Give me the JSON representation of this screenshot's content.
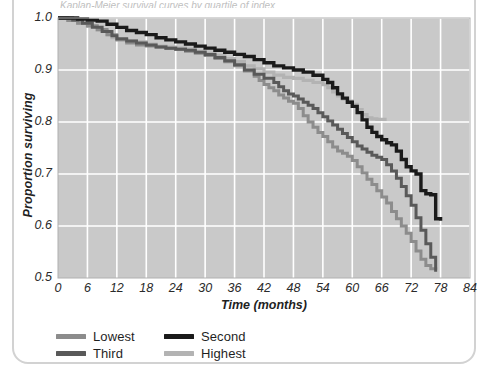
{
  "figure": {
    "title_clipped": "Kaplan-Meier survival curves by quartile of index",
    "background": "#ffffff",
    "frame_color": "#d2d2d2"
  },
  "chart_data": {
    "type": "line",
    "subtype": "kaplan-meier-step",
    "title": "",
    "xlabel": "Time (months)",
    "ylabel": "Proportion surviving",
    "xlim": [
      0,
      84
    ],
    "ylim": [
      0.5,
      1.0
    ],
    "xticks": [
      0,
      6,
      12,
      18,
      24,
      30,
      36,
      42,
      48,
      54,
      60,
      66,
      72,
      78,
      84
    ],
    "yticks": [
      0.5,
      0.6,
      0.7,
      0.8,
      0.9,
      1.0
    ],
    "xtick_labels": [
      "0",
      "6",
      "12",
      "18",
      "24",
      "30",
      "36",
      "42",
      "48",
      "54",
      "60",
      "66",
      "72",
      "78",
      "84"
    ],
    "ytick_labels": [
      "0.5",
      "0.6",
      "0.7",
      "0.8",
      "0.9",
      "1.0"
    ],
    "grid": true,
    "grid_color": "#ffffff",
    "plot_background": "#c9c9c9",
    "legend_position": "below-left",
    "legend_entries": [
      "Lowest",
      "Second",
      "Third",
      "Highest"
    ],
    "series": [
      {
        "name": "Lowest",
        "color": "#8c8c8c",
        "linewidth": 3.0,
        "points": [
          [
            0,
            1.0
          ],
          [
            2,
            0.995
          ],
          [
            4,
            0.99
          ],
          [
            6,
            0.985
          ],
          [
            8,
            0.978
          ],
          [
            10,
            0.968
          ],
          [
            12,
            0.958
          ],
          [
            14,
            0.952
          ],
          [
            16,
            0.948
          ],
          [
            18,
            0.946
          ],
          [
            20,
            0.944
          ],
          [
            22,
            0.942
          ],
          [
            24,
            0.94
          ],
          [
            26,
            0.936
          ],
          [
            28,
            0.932
          ],
          [
            30,
            0.928
          ],
          [
            32,
            0.922
          ],
          [
            34,
            0.916
          ],
          [
            36,
            0.908
          ],
          [
            38,
            0.898
          ],
          [
            40,
            0.888
          ],
          [
            41,
            0.88
          ],
          [
            42,
            0.872
          ],
          [
            43,
            0.866
          ],
          [
            44,
            0.86
          ],
          [
            45,
            0.852
          ],
          [
            46,
            0.846
          ],
          [
            47,
            0.84
          ],
          [
            48,
            0.836
          ],
          [
            49,
            0.826
          ],
          [
            50,
            0.812
          ],
          [
            51,
            0.8
          ],
          [
            52,
            0.79
          ],
          [
            53,
            0.78
          ],
          [
            54,
            0.772
          ],
          [
            55,
            0.762
          ],
          [
            56,
            0.752
          ],
          [
            57,
            0.744
          ],
          [
            58,
            0.74
          ],
          [
            59,
            0.734
          ],
          [
            60,
            0.726
          ],
          [
            61,
            0.714
          ],
          [
            62,
            0.702
          ],
          [
            63,
            0.69
          ],
          [
            64,
            0.68
          ],
          [
            65,
            0.668
          ],
          [
            66,
            0.656
          ],
          [
            67,
            0.644
          ],
          [
            68,
            0.628
          ],
          [
            69,
            0.614
          ],
          [
            70,
            0.6
          ],
          [
            71,
            0.586
          ],
          [
            72,
            0.57
          ],
          [
            73,
            0.552
          ],
          [
            74,
            0.536
          ],
          [
            75,
            0.524
          ],
          [
            76,
            0.518
          ],
          [
            77,
            0.516
          ]
        ]
      },
      {
        "name": "Second",
        "color": "#1a1a1a",
        "linewidth": 3.4,
        "points": [
          [
            0,
            1.0
          ],
          [
            4,
            0.998
          ],
          [
            6,
            0.996
          ],
          [
            8,
            0.994
          ],
          [
            10,
            0.988
          ],
          [
            12,
            0.982
          ],
          [
            14,
            0.976
          ],
          [
            16,
            0.972
          ],
          [
            18,
            0.968
          ],
          [
            20,
            0.962
          ],
          [
            22,
            0.958
          ],
          [
            24,
            0.954
          ],
          [
            26,
            0.95
          ],
          [
            28,
            0.946
          ],
          [
            30,
            0.942
          ],
          [
            32,
            0.938
          ],
          [
            34,
            0.934
          ],
          [
            36,
            0.93
          ],
          [
            38,
            0.926
          ],
          [
            40,
            0.92
          ],
          [
            42,
            0.914
          ],
          [
            44,
            0.908
          ],
          [
            46,
            0.904
          ],
          [
            48,
            0.9
          ],
          [
            50,
            0.896
          ],
          [
            52,
            0.89
          ],
          [
            54,
            0.882
          ],
          [
            55,
            0.876
          ],
          [
            56,
            0.866
          ],
          [
            57,
            0.854
          ],
          [
            58,
            0.846
          ],
          [
            59,
            0.838
          ],
          [
            60,
            0.83
          ],
          [
            61,
            0.818
          ],
          [
            62,
            0.804
          ],
          [
            63,
            0.79
          ],
          [
            64,
            0.78
          ],
          [
            65,
            0.772
          ],
          [
            66,
            0.766
          ],
          [
            67,
            0.76
          ],
          [
            68,
            0.756
          ],
          [
            69,
            0.744
          ],
          [
            70,
            0.728
          ],
          [
            71,
            0.714
          ],
          [
            72,
            0.706
          ],
          [
            73,
            0.7
          ],
          [
            74,
            0.668
          ],
          [
            75,
            0.662
          ],
          [
            76,
            0.66
          ],
          [
            77,
            0.614
          ],
          [
            78,
            0.61
          ]
        ]
      },
      {
        "name": "Third",
        "color": "#595959",
        "linewidth": 3.0,
        "points": [
          [
            0,
            1.0
          ],
          [
            3,
            0.996
          ],
          [
            5,
            0.99
          ],
          [
            7,
            0.982
          ],
          [
            9,
            0.974
          ],
          [
            11,
            0.966
          ],
          [
            12,
            0.96
          ],
          [
            14,
            0.956
          ],
          [
            16,
            0.952
          ],
          [
            18,
            0.948
          ],
          [
            20,
            0.944
          ],
          [
            22,
            0.942
          ],
          [
            24,
            0.94
          ],
          [
            26,
            0.938
          ],
          [
            28,
            0.934
          ],
          [
            30,
            0.93
          ],
          [
            32,
            0.924
          ],
          [
            34,
            0.918
          ],
          [
            36,
            0.91
          ],
          [
            38,
            0.9
          ],
          [
            40,
            0.892
          ],
          [
            42,
            0.884
          ],
          [
            44,
            0.876
          ],
          [
            45,
            0.868
          ],
          [
            46,
            0.86
          ],
          [
            47,
            0.854
          ],
          [
            48,
            0.85
          ],
          [
            49,
            0.844
          ],
          [
            50,
            0.838
          ],
          [
            51,
            0.832
          ],
          [
            52,
            0.826
          ],
          [
            53,
            0.818
          ],
          [
            54,
            0.81
          ],
          [
            55,
            0.802
          ],
          [
            56,
            0.794
          ],
          [
            57,
            0.786
          ],
          [
            58,
            0.778
          ],
          [
            59,
            0.77
          ],
          [
            60,
            0.762
          ],
          [
            61,
            0.754
          ],
          [
            62,
            0.748
          ],
          [
            63,
            0.742
          ],
          [
            64,
            0.736
          ],
          [
            65,
            0.732
          ],
          [
            66,
            0.728
          ],
          [
            67,
            0.718
          ],
          [
            68,
            0.706
          ],
          [
            69,
            0.692
          ],
          [
            70,
            0.676
          ],
          [
            71,
            0.658
          ],
          [
            72,
            0.64
          ],
          [
            73,
            0.616
          ],
          [
            74,
            0.592
          ],
          [
            75,
            0.566
          ],
          [
            76,
            0.54
          ],
          [
            77,
            0.512
          ]
        ]
      },
      {
        "name": "Highest",
        "color": "#b3b3b3",
        "linewidth": 3.2,
        "points": [
          [
            0,
            1.0
          ],
          [
            2,
            0.996
          ],
          [
            4,
            0.99
          ],
          [
            6,
            0.984
          ],
          [
            8,
            0.976
          ],
          [
            10,
            0.968
          ],
          [
            11,
            0.962
          ],
          [
            12,
            0.958
          ],
          [
            14,
            0.956
          ],
          [
            16,
            0.954
          ],
          [
            18,
            0.95
          ],
          [
            20,
            0.946
          ],
          [
            22,
            0.944
          ],
          [
            24,
            0.942
          ],
          [
            26,
            0.94
          ],
          [
            28,
            0.936
          ],
          [
            30,
            0.932
          ],
          [
            32,
            0.928
          ],
          [
            34,
            0.922
          ],
          [
            36,
            0.916
          ],
          [
            38,
            0.908
          ],
          [
            40,
            0.902
          ],
          [
            42,
            0.896
          ],
          [
            44,
            0.89
          ],
          [
            46,
            0.886
          ],
          [
            48,
            0.884
          ],
          [
            50,
            0.88
          ],
          [
            52,
            0.876
          ],
          [
            54,
            0.872
          ],
          [
            55,
            0.866
          ],
          [
            56,
            0.858
          ],
          [
            57,
            0.85
          ],
          [
            58,
            0.844
          ],
          [
            59,
            0.84
          ],
          [
            60,
            0.834
          ],
          [
            61,
            0.824
          ],
          [
            62,
            0.814
          ],
          [
            63,
            0.808
          ],
          [
            64,
            0.806
          ],
          [
            65,
            0.805
          ],
          [
            66,
            0.805
          ],
          [
            67,
            0.805
          ]
        ]
      }
    ]
  }
}
